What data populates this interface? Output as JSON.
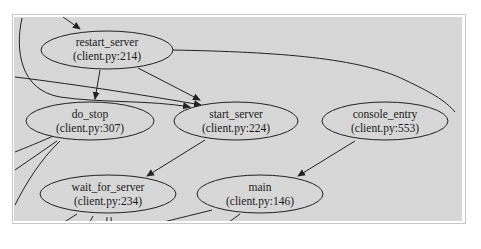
{
  "diagram": {
    "type": "call-graph",
    "colors": {
      "background": "#d7d7d7",
      "node_fill": "#d7d7d7",
      "stroke": "#222222",
      "frame": "#ffffff"
    },
    "nodes": [
      {
        "id": "restart_server",
        "name": "restart_server",
        "location": "(client.py:214)"
      },
      {
        "id": "do_stop",
        "name": "do_stop",
        "location": "(client.py:307)"
      },
      {
        "id": "start_server",
        "name": "start_server",
        "location": "(client.py:224)"
      },
      {
        "id": "console_entry",
        "name": "console_entry",
        "location": "(client.py:553)"
      },
      {
        "id": "wait_for_server",
        "name": "wait_for_server",
        "location": "(client.py:234)"
      },
      {
        "id": "main",
        "name": "main",
        "location": "(client.py:146)"
      }
    ],
    "edges": [
      {
        "from": "restart_server",
        "to": "do_stop"
      },
      {
        "from": "restart_server",
        "to": "start_server"
      },
      {
        "from": "start_server",
        "to": "wait_for_server"
      },
      {
        "from": "console_entry",
        "to": "main"
      },
      {
        "from": "(offscreen)",
        "to": "restart_server"
      },
      {
        "from": "(offscreen)",
        "to": "start_server"
      }
    ]
  }
}
